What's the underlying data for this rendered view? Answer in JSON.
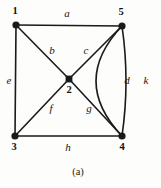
{
  "figure": {
    "caption": "(a)",
    "caption_x": 78,
    "caption_y": 172,
    "width": 161,
    "height": 188,
    "background_color": "#fdfdfc",
    "ink_color": "#1a1a1a"
  },
  "graph": {
    "type": "undirected-multigraph",
    "vertex_shape_default": "filled-circle",
    "vertices": [
      {
        "id": "1",
        "label": "1",
        "x": 16,
        "y": 25,
        "shape": "circle",
        "r": 3.6,
        "label_x": 15,
        "label_y": 11
      },
      {
        "id": "5",
        "label": "5",
        "x": 122,
        "y": 26,
        "shape": "circle",
        "r": 3.6,
        "label_x": 121,
        "label_y": 12
      },
      {
        "id": "2",
        "label": "2",
        "x": 69,
        "y": 79,
        "shape": "square",
        "r": 3.4,
        "label_x": 69,
        "label_y": 90
      },
      {
        "id": "3",
        "label": "3",
        "x": 15,
        "y": 136,
        "shape": "circle",
        "r": 3.6,
        "label_x": 14,
        "label_y": 147
      },
      {
        "id": "4",
        "label": "4",
        "x": 122,
        "y": 136,
        "shape": "circle",
        "r": 3.6,
        "label_x": 122,
        "label_y": 147
      }
    ],
    "edges": [
      {
        "id": "a",
        "label": "a",
        "from": "1",
        "to": "5",
        "kind": "straight",
        "label_x": 67,
        "label_y": 13
      },
      {
        "id": "b",
        "label": "b",
        "from": "1",
        "to": "2",
        "kind": "straight",
        "label_x": 52,
        "label_y": 50
      },
      {
        "id": "c",
        "label": "c",
        "from": "5",
        "to": "2",
        "kind": "straight",
        "label_x": 86,
        "label_y": 50
      },
      {
        "id": "e",
        "label": "e",
        "from": "1",
        "to": "3",
        "kind": "straight",
        "label_x": 9,
        "label_y": 80
      },
      {
        "id": "f",
        "label": "f",
        "from": "3",
        "to": "2",
        "kind": "straight",
        "label_x": 51,
        "label_y": 108
      },
      {
        "id": "g",
        "label": "g",
        "from": "2",
        "to": "4",
        "kind": "straight",
        "label_x": 89,
        "label_y": 108
      },
      {
        "id": "h",
        "label": "h",
        "from": "3",
        "to": "4",
        "kind": "straight",
        "label_x": 68,
        "label_y": 147
      },
      {
        "id": "d",
        "label": "d",
        "from": "5",
        "to": "4",
        "kind": "curve-left",
        "bulge": 4,
        "label_x": 127,
        "label_y": 80
      },
      {
        "id": "k",
        "label": "k",
        "from": "5",
        "to": "4",
        "kind": "curve-right",
        "bulge": 26,
        "label_x": 146,
        "label_y": 80
      }
    ]
  }
}
